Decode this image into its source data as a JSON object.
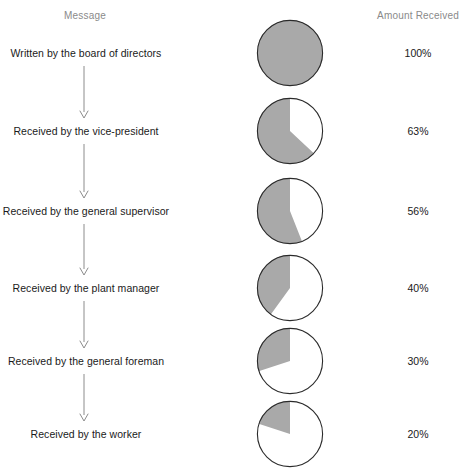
{
  "header": {
    "message_label": "Message",
    "amount_label": "Amount Received"
  },
  "style": {
    "slice_fill": "#a9a9a9",
    "slice_empty": "#ffffff",
    "pie_stroke": "#2b2b2b",
    "arrow_color": "#8c8c8c",
    "header_color": "#8a8a8a",
    "text_color": "#1a1a1a",
    "background": "#ffffff"
  },
  "chart_data": {
    "type": "pie",
    "title": "",
    "subtitle": "",
    "xlabel": "Message",
    "ylabel": "Amount Received",
    "legend": [],
    "grid": false,
    "direction": "counterclockwise-from-top",
    "units": "%",
    "categories": [
      "Written by the board of directors",
      "Received by the vice-president",
      "Received by the general supervisor",
      "Received by the plant manager",
      "Received by the general foreman",
      "Received by the worker"
    ],
    "values": [
      100,
      63,
      56,
      40,
      30,
      20
    ],
    "value_labels": [
      "100%",
      "63%",
      "56%",
      "40%",
      "30%",
      "20%"
    ]
  },
  "rows": [
    {
      "label": "Written by the board of directors",
      "value_label": "100%",
      "value": 100,
      "center_y": 53,
      "pie_name": "pie-chart-board-of-directors",
      "arrow_name": "arrow-board-to-vice-president"
    },
    {
      "label": "Received by the vice-president",
      "value_label": "63%",
      "value": 63,
      "center_y": 131,
      "pie_name": "pie-chart-vice-president",
      "arrow_name": "arrow-vice-president-to-general-supervisor"
    },
    {
      "label": "Received by the general supervisor",
      "value_label": "56%",
      "value": 56,
      "center_y": 211,
      "pie_name": "pie-chart-general-supervisor",
      "arrow_name": "arrow-general-supervisor-to-plant-manager"
    },
    {
      "label": "Received by the plant manager",
      "value_label": "40%",
      "value": 40,
      "center_y": 288,
      "pie_name": "pie-chart-plant-manager",
      "arrow_name": "arrow-plant-manager-to-general-foreman"
    },
    {
      "label": "Received by the general foreman",
      "value_label": "30%",
      "value": 30,
      "center_y": 361,
      "pie_name": "pie-chart-general-foreman",
      "arrow_name": "arrow-general-foreman-to-worker"
    },
    {
      "label": "Received by the worker",
      "value_label": "20%",
      "value": 20,
      "center_y": 434,
      "pie_name": "pie-chart-worker",
      "arrow_name": ""
    }
  ]
}
